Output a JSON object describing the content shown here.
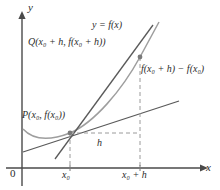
{
  "figure": {
    "colors": {
      "axis": "#4a4a4a",
      "curve": "#8f8f8f",
      "secant": "#555555",
      "tangent": "#555555",
      "dashed": "#9a9a9a",
      "text": "#2b2b2b",
      "background": "#ffffff"
    },
    "axes": {
      "y_label": "y",
      "x_label": "x",
      "origin_label": "0",
      "x_axis_y": 168,
      "y_axis_x": 22
    },
    "labels": {
      "curve": "y = f(x)",
      "point_q": "Q(x₀ + h, f(x₀ + h))",
      "point_p": "P(x₀, f(x₀))",
      "rise": "f(x₀ + h) − f(x₀)",
      "run": "h",
      "tick_x0": "x₀",
      "tick_x0_plus_h": "x₀ + h"
    },
    "geometry": {
      "point_p": {
        "x": 70,
        "y": 133
      },
      "point_q": {
        "x": 140,
        "y": 57
      },
      "tick_x0": 70,
      "tick_x0_plus_h": 140,
      "curve_path": "M 23 129 C 34 141, 52 140, 70 133 C 94 123, 122 90, 140 57 C 147 44, 154 31, 159 22",
      "secant_line": {
        "x1": 55,
        "y1": 159,
        "x2": 153,
        "y2": 25
      },
      "tangent_line": {
        "x1": 23,
        "y1": 152,
        "x2": 179,
        "y2": 101
      },
      "dash_vertical_x0": {
        "x": 70,
        "y1": 133,
        "y2": 168
      },
      "dash_vertical_x0h": {
        "x": 140,
        "y1": 57,
        "y2": 168
      },
      "dash_horizontal": {
        "x1": 70,
        "x2": 140,
        "y": 133
      }
    }
  }
}
